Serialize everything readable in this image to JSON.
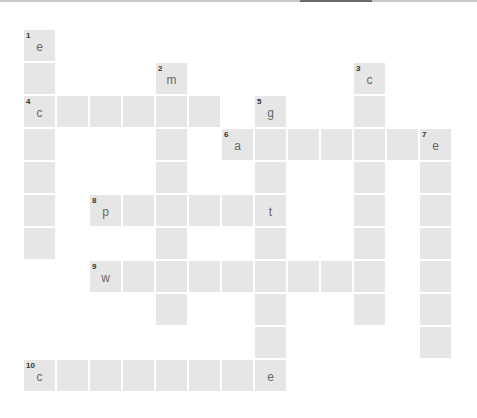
{
  "puzzle": {
    "type": "crossword",
    "grid_origin": {
      "x": 24,
      "y": 30
    },
    "cell_pitch": 33,
    "cell_size": 31,
    "colors": {
      "cell": "#e6e6e6",
      "number": "#333333",
      "letter": "#666666",
      "background": "#ffffff"
    },
    "clues": [
      {
        "number": "1",
        "direction": "down",
        "row": 0,
        "col": 0,
        "length": 7,
        "revealed": {
          "0": "e"
        }
      },
      {
        "number": "2",
        "direction": "down",
        "row": 1,
        "col": 4,
        "length": 8,
        "revealed": {
          "0": "m"
        }
      },
      {
        "number": "3",
        "direction": "down",
        "row": 1,
        "col": 10,
        "length": 8,
        "revealed": {
          "0": "c"
        }
      },
      {
        "number": "4",
        "direction": "across",
        "row": 2,
        "col": 0,
        "length": 6,
        "revealed": {
          "0": "c"
        }
      },
      {
        "number": "5",
        "direction": "down",
        "row": 2,
        "col": 7,
        "length": 9,
        "revealed": {
          "0": "g",
          "3": "t",
          "8": "e"
        }
      },
      {
        "number": "6",
        "direction": "across",
        "row": 3,
        "col": 6,
        "length": 7,
        "revealed": {
          "0": "a",
          "6": "e"
        }
      },
      {
        "number": "7",
        "direction": "down",
        "row": 3,
        "col": 12,
        "length": 7,
        "revealed": {
          "0": "e"
        }
      },
      {
        "number": "8",
        "direction": "across",
        "row": 5,
        "col": 2,
        "length": 6,
        "revealed": {
          "0": "p",
          "5": "t"
        }
      },
      {
        "number": "9",
        "direction": "across",
        "row": 7,
        "col": 2,
        "length": 9,
        "revealed": {
          "0": "w"
        }
      },
      {
        "number": "10",
        "direction": "across",
        "row": 10,
        "col": 0,
        "length": 8,
        "revealed": {
          "0": "c",
          "7": "e"
        }
      }
    ]
  }
}
